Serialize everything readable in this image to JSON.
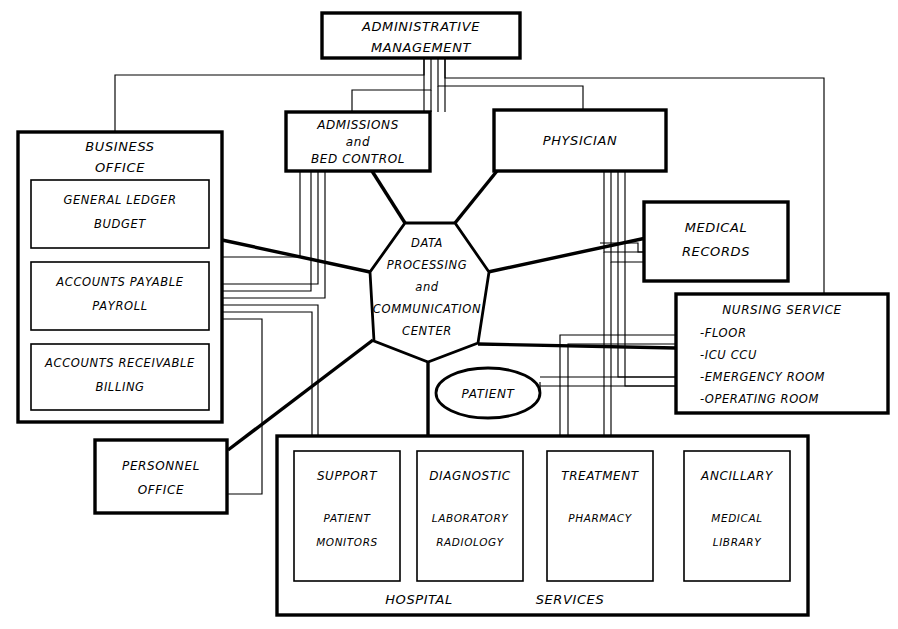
{
  "diagram": {
    "background_color": "#ffffff",
    "line_color": "#000000"
  },
  "nodes": {
    "admin": {
      "name": "administrative-management",
      "line1": "ADMINISTRATIVE",
      "line2": "MANAGEMENT"
    },
    "business_office": {
      "name": "business-office",
      "line1": "BUSINESS",
      "line2": "OFFICE",
      "sub": [
        {
          "name": "general-ledger-budget",
          "line1": "GENERAL   LEDGER",
          "line2": "BUDGET"
        },
        {
          "name": "accounts-payable-payroll",
          "line1": "ACCOUNTS   PAYABLE",
          "line2": "PAYROLL"
        },
        {
          "name": "accounts-receivable-billing",
          "line1": "ACCOUNTS RECEIVABLE",
          "line2": "BILLING"
        }
      ]
    },
    "admissions": {
      "name": "admissions-bed-control",
      "line1": "ADMISSIONS",
      "line2": "and",
      "line3": "BED CONTROL"
    },
    "physician": {
      "name": "physician",
      "line1": "PHYSICIAN"
    },
    "medical_records": {
      "name": "medical-records",
      "line1": "MEDICAL",
      "line2": "RECORDS"
    },
    "nursing_service": {
      "name": "nursing-service",
      "title": "NURSING  SERVICE",
      "items": [
        "-FLOOR",
        "-ICU CCU",
        "-EMERGENCY ROOM",
        "-OPERATING ROOM"
      ]
    },
    "center": {
      "name": "data-processing-and-communication-center",
      "line1": "DATA",
      "line2": "PROCESSING",
      "line3": "and",
      "line4": "COMMUNICATION",
      "line5": "CENTER"
    },
    "patient": {
      "name": "patient",
      "label": "PATIENT"
    },
    "personnel_office": {
      "name": "personnel-office",
      "line1": "PERSONNEL",
      "line2": "OFFICE"
    },
    "hospital_services": {
      "name": "hospital-services",
      "footer_left": "HOSPITAL",
      "footer_right": "SERVICES",
      "columns": [
        {
          "name": "support",
          "heading": "SUPPORT",
          "line1": "PATIENT",
          "line2": "MONITORS"
        },
        {
          "name": "diagnostic",
          "heading": "DIAGNOSTIC",
          "line1": "LABORATORY",
          "line2": "RADIOLOGY"
        },
        {
          "name": "treatment",
          "heading": "TREATMENT",
          "line1": "PHARMACY",
          "line2": ""
        },
        {
          "name": "ancillary",
          "heading": "ANCILLARY",
          "line1": "MEDICAL",
          "line2": "LIBRARY"
        }
      ]
    }
  }
}
